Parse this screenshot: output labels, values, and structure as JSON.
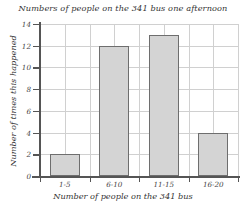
{
  "chart_data": {
    "type": "bar",
    "title": "Numbers of people on the 341 bus one afternoon",
    "xlabel": "Number of people on the 341 bus",
    "ylabel": "Number of times this happened",
    "categories": [
      "1-5",
      "6-10",
      "11-15",
      "16-20"
    ],
    "values": [
      2,
      12,
      13,
      4
    ],
    "ylim": [
      0,
      14
    ],
    "ytick_labels": [
      "0",
      "2",
      "4",
      "6",
      "8",
      "10",
      "12",
      "14"
    ],
    "ytick_values": [
      0,
      2,
      4,
      6,
      8,
      10,
      12,
      14
    ],
    "grid": true,
    "legend": "none",
    "colors": {
      "bar_fill": "#d4d4d4",
      "bar_border": "#6e6e6e",
      "grid": "#d0d0d0",
      "axis": "#555555",
      "text": "#333333",
      "background": "#ffffff"
    }
  }
}
